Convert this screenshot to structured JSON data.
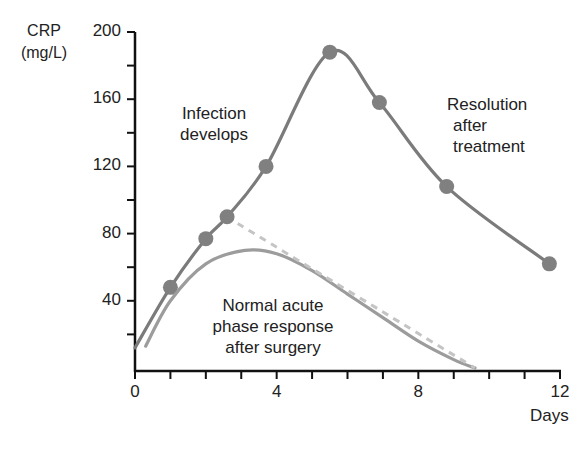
{
  "chart_data": {
    "type": "line",
    "title": "",
    "xlabel": "Days",
    "ylabel": "CRP (mg/L)",
    "ylabel_lines": [
      "CRP",
      "(mg/L)"
    ],
    "xlim": [
      0,
      12
    ],
    "ylim": [
      0,
      200
    ],
    "x_ticks": [
      0,
      4,
      8,
      12
    ],
    "x_minor_ticks": [
      1,
      2,
      3,
      5,
      6,
      7,
      9,
      10,
      11
    ],
    "y_ticks": [
      40,
      80,
      120,
      160,
      200
    ],
    "y_minor_ticks": [
      20,
      60,
      100,
      140,
      180
    ],
    "grid": false,
    "legend": "none",
    "series": [
      {
        "name": "Infection (with treatment)",
        "style": "solid-with-markers",
        "color": "#7b7b7b",
        "x": [
          0,
          1,
          2,
          2.6,
          3.7,
          5.5,
          6.9,
          8.8,
          11.7
        ],
        "values": [
          12,
          48,
          77,
          90,
          120,
          188,
          158,
          108,
          62
        ],
        "markers_at": [
          1,
          2,
          2.6,
          3.7,
          5.5,
          6.9,
          8.8,
          11.7
        ]
      },
      {
        "name": "Normal acute phase response after surgery",
        "style": "solid",
        "color": "#9c9c9c",
        "x": [
          0.3,
          1,
          2,
          3.1,
          4,
          5,
          6,
          7,
          8,
          9,
          9.6
        ],
        "values": [
          13,
          40,
          62,
          70,
          68,
          58,
          44,
          30,
          16,
          5,
          0
        ]
      },
      {
        "name": "Expected decline (projected)",
        "style": "dashed",
        "color": "#c4c4c4",
        "x": [
          2.9,
          9.6
        ],
        "values": [
          86,
          0
        ]
      }
    ],
    "annotations": [
      {
        "text": "Infection developing",
        "lines": [
          "Infection",
          "develops"
        ]
      },
      {
        "text": "Resolution after treatment",
        "lines": [
          "Resolution",
          "after",
          "treatment"
        ]
      },
      {
        "text": "Normal acute phase response after surgery",
        "lines": [
          "Normal acute",
          "phase response",
          "after surgery"
        ]
      }
    ]
  },
  "axis": {
    "y_label_line1": "CRP",
    "y_label_line2": "(mg/L)",
    "x_label": "Days",
    "y_tick_labels": [
      "200",
      "160",
      "120",
      "80",
      "40"
    ],
    "x_tick_labels": [
      "0",
      "4",
      "8",
      "12"
    ]
  },
  "annotations": {
    "infection_1": "Infection",
    "infection_2": "develops",
    "resolution_1": "Resolution",
    "resolution_2": "after",
    "resolution_3": "treatment",
    "normal_1": "Normal acute",
    "normal_2": "phase response",
    "normal_3": "after surgery"
  },
  "colors": {
    "axis": "#111111",
    "infection_line": "#7b7b7b",
    "marker": "#808080",
    "normal_line": "#9c9c9c",
    "dashed_line": "#c4c4c4"
  }
}
